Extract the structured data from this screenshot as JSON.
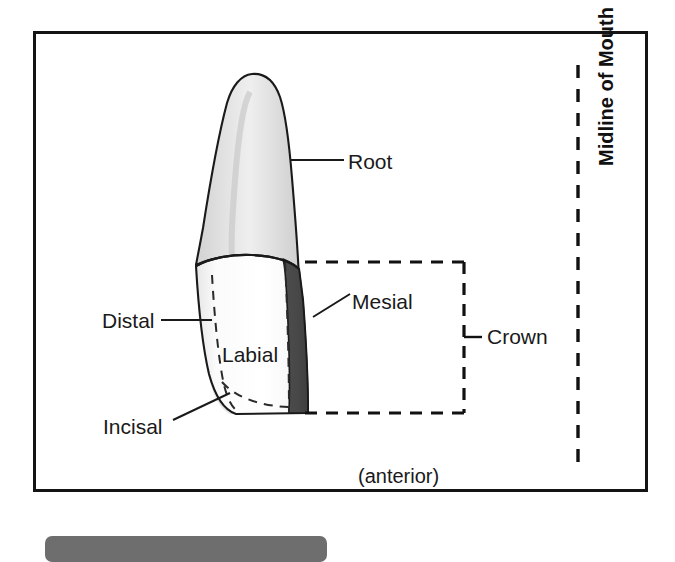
{
  "figure": {
    "view_note": "(anterior)"
  },
  "frame": {
    "border_color": "#141414"
  },
  "labels": {
    "root": "Root",
    "mesial": "Mesial",
    "crown": "Crown",
    "distal": "Distal",
    "incisal": "Incisal",
    "labial": "Labial",
    "anterior": "(anterior)",
    "midline": "Midline of Mouth"
  },
  "colors": {
    "outline": "#1a1a1a",
    "root_fill": "#dcdcdc",
    "root_highlight": "#ededed",
    "crown_labial_fill": "#ffffff",
    "crown_distal_fill": "#e4e4e4",
    "crown_mesial_fill": "#4a4a4a",
    "leader_line": "#1a1a1a",
    "dashed_line": "#111111",
    "bottom_bar": "#6e6e6e",
    "background": "#ffffff"
  },
  "regions": [
    {
      "name": "root",
      "label": "Root",
      "shading": "light-gray",
      "description": "tapered root above the cervical line"
    },
    {
      "name": "crown",
      "label": "Crown",
      "shading": "mixed",
      "description": "bracketed by dashed rectangle on the right"
    },
    {
      "name": "labial-surface",
      "label": "Labial",
      "shading": "white",
      "description": "front facing surface of the crown"
    },
    {
      "name": "mesial-surface",
      "label": "Mesial",
      "shading": "dark-gray",
      "description": "surface toward the midline of the mouth"
    },
    {
      "name": "distal-surface",
      "label": "Distal",
      "shading": "light-gray",
      "description": "surface away from the midline, dashed edge"
    },
    {
      "name": "incisal-edge",
      "label": "Incisal",
      "shading": "dashed",
      "description": "biting edge at the bottom of the crown"
    }
  ],
  "markers": {
    "midline_style": "vertical dashed line",
    "crown_bracket_style": "dashed rectangle open on the left with center tick"
  }
}
